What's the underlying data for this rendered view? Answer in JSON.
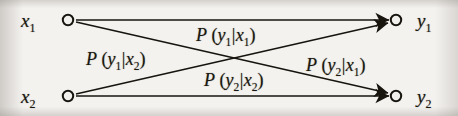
{
  "figure": {
    "type": "binary-channel-transition-diagram",
    "title": "",
    "ink_color": "#19170f",
    "background_color": "#f2f0ed"
  },
  "nodes": {
    "inputs": [
      {
        "id": "x1",
        "label": "x",
        "subscript": "1",
        "shape": "open-circle",
        "cx": 68,
        "cy": 20
      },
      {
        "id": "x2",
        "label": "x",
        "subscript": "2",
        "shape": "open-circle",
        "cx": 68,
        "cy": 96
      }
    ],
    "outputs": [
      {
        "id": "y1",
        "label": "y",
        "subscript": "1",
        "shape": "open-circle",
        "cx": 396,
        "cy": 20
      },
      {
        "id": "y2",
        "label": "y",
        "subscript": "2",
        "shape": "open-circle",
        "cx": 396,
        "cy": 96
      }
    ]
  },
  "edges": [
    {
      "id": "x1-y1",
      "from": "x1",
      "to": "y1",
      "arrowhead": "filled-triangle",
      "label": {
        "fn": "P",
        "open": "(",
        "num": "y",
        "num_sub": "1",
        "bar": "|",
        "den": "x",
        "den_sub": "1",
        "close": ")"
      }
    },
    {
      "id": "x1-y2",
      "from": "x1",
      "to": "y2",
      "arrowhead": "filled-triangle",
      "label": {
        "fn": "P",
        "open": "(",
        "num": "y",
        "num_sub": "2",
        "bar": "|",
        "den": "x",
        "den_sub": "1",
        "close": ")"
      }
    },
    {
      "id": "x2-y1",
      "from": "x2",
      "to": "y1",
      "arrowhead": "filled-triangle",
      "label": {
        "fn": "P",
        "open": "(",
        "num": "y",
        "num_sub": "1",
        "bar": "|",
        "den": "x",
        "den_sub": "2",
        "close": ")"
      }
    },
    {
      "id": "x2-y2",
      "from": "x2",
      "to": "y2",
      "arrowhead": "filled-triangle",
      "label": {
        "fn": "P",
        "open": "(",
        "num": "y",
        "num_sub": "2",
        "bar": "|",
        "den": "x",
        "den_sub": "2",
        "close": ")"
      }
    }
  ]
}
